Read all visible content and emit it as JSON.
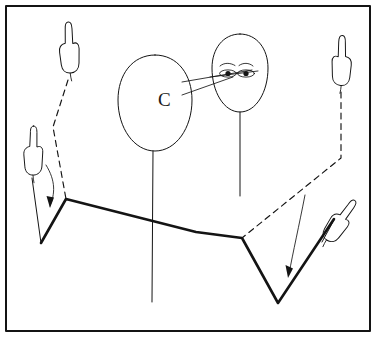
{
  "figure": {
    "background_color": "#ffffff",
    "ink_color": "#141414",
    "frame": {
      "name": "outer-border",
      "x": 6,
      "y": 6,
      "width": 364,
      "height": 325,
      "stroke_width": 2
    },
    "labels": [
      {
        "id": "head-label-c",
        "text": "C",
        "x": 158,
        "y": 106
      }
    ],
    "heads": [
      {
        "id": "head-left-blank",
        "description": "large blank oval head with letter C",
        "cx": 155,
        "cy": 103,
        "rx": 37,
        "ry": 48,
        "stem": {
          "x": 153,
          "y1": 152,
          "y2": 302
        }
      },
      {
        "id": "head-right-face",
        "description": "oval face with two eyes and eyebrows",
        "cx": 240,
        "cy": 73,
        "rx": 27,
        "ry": 39,
        "stem": {
          "x": 240,
          "y1": 112,
          "y2": 196
        }
      }
    ],
    "eyes": [
      {
        "id": "eye-left",
        "cx": 228,
        "cy": 73,
        "rx": 8,
        "ry": 3.4,
        "pupil_r": 2.3
      },
      {
        "id": "eye-right",
        "cx": 246,
        "cy": 73,
        "rx": 8,
        "ry": 3.4,
        "pupil_r": 2.3
      }
    ],
    "eyebrows": [
      {
        "id": "eyebrow-left",
        "x": 220,
        "y": 65
      },
      {
        "id": "eyebrow-right",
        "x": 238,
        "y": 65
      }
    ],
    "sight_lines": [
      {
        "id": "sight-line-upper",
        "x1": 183,
        "y1": 82,
        "x2": 232,
        "y2": 71
      },
      {
        "id": "sight-line-lower",
        "x1": 183,
        "y1": 94,
        "x2": 232,
        "y2": 76
      }
    ],
    "hands": [
      {
        "id": "hand-top-left",
        "cx": 69,
        "cy": 50,
        "rotation": -8,
        "scale": 1.0
      },
      {
        "id": "hand-mid-left",
        "cx": 34,
        "cy": 155,
        "rotation": -4,
        "scale": 1.0
      },
      {
        "id": "hand-top-right",
        "cx": 342,
        "cy": 63,
        "rotation": 6,
        "scale": 1.0
      },
      {
        "id": "hand-bottom-right",
        "cx": 337,
        "cy": 225,
        "rotation": 36,
        "scale": 1.0
      }
    ],
    "plane_polygon": {
      "id": "folded-plane",
      "points": "41,243 66,199 196,232 242,238 278,303 334,219",
      "stroke_width": 2.6
    },
    "dashed_connectors": [
      {
        "id": "dashed-left-hand-to-vertex",
        "points": "68,78 54,125 66,199"
      },
      {
        "id": "dashed-right-hand-to-vertex",
        "points": "341,90 341,158 242,238"
      }
    ],
    "curved_arrows": [
      {
        "id": "arrow-left-down",
        "path": "M 47,167 C 56,184 54,196 49,207",
        "tip": "49,207"
      },
      {
        "id": "arrow-right-down",
        "path": "M 306,196 C 299,228 292,254 288,276",
        "tip": "288,276"
      }
    ],
    "hand_stems": [
      {
        "id": "hand-stem-mid-left",
        "x1": 33,
        "y1": 180,
        "x2": 41,
        "y2": 243
      },
      {
        "id": "hand-stem-bottom-right",
        "x1": 325,
        "y1": 239,
        "x2": 334,
        "y2": 219
      }
    ]
  }
}
